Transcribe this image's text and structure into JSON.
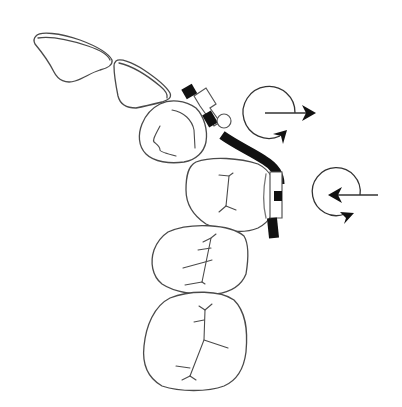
{
  "diagram": {
    "title": "",
    "colors": {
      "background": "#ffffff",
      "outline": "#4a4a4a",
      "wire": "#111111"
    },
    "teeth": [
      {
        "id": "incisor-1",
        "type": "incisor"
      },
      {
        "id": "incisor-2",
        "type": "incisor"
      },
      {
        "id": "canine",
        "type": "canine"
      },
      {
        "id": "premolar-1",
        "type": "premolar"
      },
      {
        "id": "premolar-2",
        "type": "premolar"
      },
      {
        "id": "molar",
        "type": "molar"
      }
    ],
    "appliance": {
      "archwire": "rectangular wire bent around canine",
      "brackets": 2,
      "loop": "small circular loop at canine bracket"
    },
    "arrows": [
      {
        "id": "rotation-arrow-upper",
        "direction": "right",
        "rotation": "clockwise"
      },
      {
        "id": "rotation-arrow-lower",
        "direction": "left",
        "rotation": "counterclockwise"
      }
    ]
  }
}
